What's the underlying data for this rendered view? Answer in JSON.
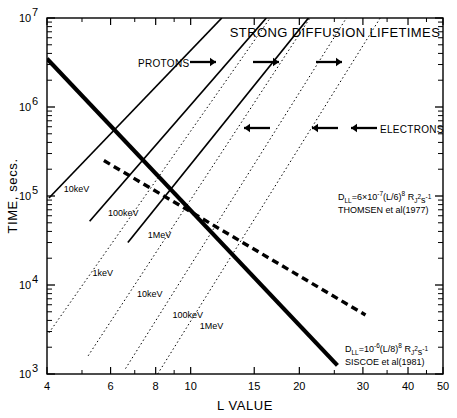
{
  "chart_data": {
    "type": "line",
    "title": "STRONG DIFFUSION LIFETIMES",
    "xlabel": "L VALUE",
    "ylabel": "TIME, secs.",
    "xscale": "log",
    "yscale": "log",
    "xlim": [
      4,
      50
    ],
    "ylim": [
      1000,
      10000000
    ],
    "grid": false,
    "legend": "none",
    "xticks": [
      {
        "value": 4,
        "label": "4"
      },
      {
        "value": 6,
        "label": "6"
      },
      {
        "value": 8,
        "label": "8"
      },
      {
        "value": 10,
        "label": "10"
      },
      {
        "value": 15,
        "label": "15"
      },
      {
        "value": 20,
        "label": "20"
      },
      {
        "value": 30,
        "label": "30"
      },
      {
        "value": 40,
        "label": "40"
      },
      {
        "value": 50,
        "label": "50"
      }
    ],
    "yticks": [
      {
        "value": 1000,
        "mantissa": "10",
        "exponent": "3"
      },
      {
        "value": 10000,
        "mantissa": "10",
        "exponent": "4"
      },
      {
        "value": 100000,
        "mantissa": "10",
        "exponent": "5"
      },
      {
        "value": 1000000,
        "mantissa": "10",
        "exponent": "6"
      },
      {
        "value": 10000000,
        "mantissa": "10",
        "exponent": "7"
      }
    ],
    "series": [
      {
        "name": "Protons 10keV",
        "label": "10keV",
        "style": "solid",
        "particle": "protons",
        "points": [
          [
            4.05,
            95000
          ],
          [
            12.2,
            10000000
          ]
        ],
        "label_at": [
          4.45,
          112000
        ]
      },
      {
        "name": "Protons 100keV",
        "label": "100keV",
        "style": "solid",
        "particle": "protons",
        "points": [
          [
            5.25,
            52000
          ],
          [
            16.2,
            10000000
          ]
        ],
        "label_at": [
          5.9,
          60000
        ]
      },
      {
        "name": "Protons 1MeV",
        "label": "1MeV",
        "style": "solid",
        "particle": "protons",
        "points": [
          [
            6.7,
            30000
          ],
          [
            21.2,
            10000000
          ]
        ],
        "label_at": [
          7.6,
          34000
        ]
      },
      {
        "name": "Electrons 1keV",
        "label": "1keV",
        "style": "dotted",
        "particle": "electrons",
        "points": [
          [
            4.05,
            2900
          ],
          [
            16.6,
            10000000
          ]
        ],
        "label_at": [
          5.35,
          12500
        ]
      },
      {
        "name": "Electrons 10keV",
        "label": "10keV",
        "style": "dotted",
        "particle": "electrons",
        "points": [
          [
            5.2,
            1600
          ],
          [
            21.4,
            10000000
          ]
        ],
        "label_at": [
          7.1,
          7400
        ]
      },
      {
        "name": "Electrons 100keV",
        "label": "100keV",
        "style": "dotted",
        "particle": "electrons",
        "points": [
          [
            6.6,
            1150
          ],
          [
            27.0,
            10000000
          ]
        ],
        "label_at": [
          8.9,
          4300
        ]
      },
      {
        "name": "Electrons 1MeV",
        "label": "1MeV",
        "style": "dotted",
        "particle": "electrons",
        "points": [
          [
            8.1,
            1000
          ],
          [
            33.5,
            10000000
          ]
        ],
        "label_at": [
          10.6,
          3200
        ]
      },
      {
        "name": "Thomsen radial diffusion",
        "label": "",
        "style": "dashed-thick",
        "particle": "diffusion",
        "points": [
          [
            5.75,
            250000
          ],
          [
            30.5,
            4600
          ]
        ]
      },
      {
        "name": "Siscoe radial diffusion",
        "label": "",
        "style": "solid-thick",
        "particle": "diffusion",
        "points": [
          [
            4.0,
            3500000
          ],
          [
            25.5,
            1250
          ]
        ]
      }
    ],
    "annotations": [
      {
        "name": "thomsen-annotation",
        "formula": "D",
        "formula_sub": "LL",
        "formula_rest": "=6×10",
        "formula_exp": "-7",
        "formula_tail": "(L/6)",
        "formula_tail_exp": "8",
        "formula_unit": " R",
        "formula_unit_sub": "J",
        "formula_unit_exp": "2",
        "formula_unit_tail": "s",
        "formula_unit_tail_exp": "-1",
        "citation": "THOMSEN et al(1977)"
      },
      {
        "name": "siscoe-annotation",
        "formula": "D",
        "formula_sub": "LL",
        "formula_rest": "=10",
        "formula_exp": "-6",
        "formula_tail": "(L/8)",
        "formula_tail_exp": "8",
        "formula_unit": " R",
        "formula_unit_sub": "J",
        "formula_unit_exp": "2",
        "formula_unit_tail": "s",
        "formula_unit_tail_exp": "-1",
        "citation": "SISCOE et al(1981)"
      }
    ],
    "species_markers": [
      {
        "name": "protons",
        "label": "PROTONS",
        "direction": "right",
        "arrow_count": 3
      },
      {
        "name": "electrons",
        "label": "ELECTRONS",
        "direction": "left",
        "arrow_count": 3
      }
    ]
  }
}
